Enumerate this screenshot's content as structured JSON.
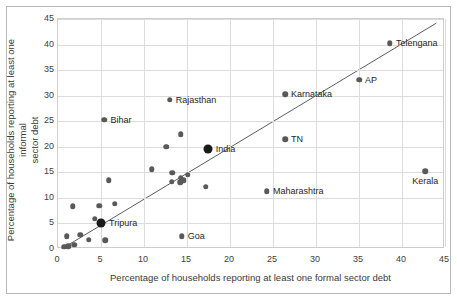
{
  "chart_data": {
    "type": "scatter",
    "title": "",
    "xlabel": "Percentage of households reporting at least one formal sector debt",
    "ylabel_line1": "Percentage of households reporting at least one informal",
    "ylabel_line2": "sector debt",
    "xlim": [
      0,
      45
    ],
    "ylim": [
      0,
      45
    ],
    "xticks": [
      0,
      5,
      10,
      15,
      20,
      25,
      30,
      35,
      40,
      45
    ],
    "yticks": [
      0,
      5,
      10,
      15,
      20,
      25,
      30,
      35,
      40,
      45
    ],
    "grid": true,
    "legend": "none",
    "annotations": [
      {
        "label": "Rajasthan",
        "x": 13.0,
        "y": 29.2,
        "side": "right"
      },
      {
        "label": "Bihar",
        "x": 5.4,
        "y": 25.3,
        "side": "right"
      },
      {
        "label": "Telengana",
        "x": 38.6,
        "y": 40.3,
        "side": "right"
      },
      {
        "label": "AP",
        "x": 35.0,
        "y": 33.1,
        "side": "right"
      },
      {
        "label": "Karnataka",
        "x": 26.4,
        "y": 30.3,
        "side": "right"
      },
      {
        "label": "TN",
        "x": 26.4,
        "y": 21.5,
        "side": "right"
      },
      {
        "label": "India",
        "x": 17.4,
        "y": 19.5,
        "side": "right",
        "highlight": true
      },
      {
        "label": "Maharashtra",
        "x": 24.3,
        "y": 11.3,
        "side": "right"
      },
      {
        "label": "Kerala",
        "x": 42.7,
        "y": 15.2,
        "side": "below"
      },
      {
        "label": "Tripura",
        "x": 5.0,
        "y": 5.0,
        "side": "right",
        "highlight": true
      },
      {
        "label": "Goa",
        "x": 14.4,
        "y": 2.5,
        "side": "right"
      }
    ],
    "points": [
      {
        "x": 13.0,
        "y": 29.2
      },
      {
        "x": 5.4,
        "y": 25.3
      },
      {
        "x": 38.6,
        "y": 40.3
      },
      {
        "x": 35.0,
        "y": 33.1
      },
      {
        "x": 26.4,
        "y": 30.3
      },
      {
        "x": 26.4,
        "y": 21.5
      },
      {
        "x": 24.3,
        "y": 11.3
      },
      {
        "x": 42.7,
        "y": 15.2
      },
      {
        "x": 14.4,
        "y": 2.5
      },
      {
        "x": 14.3,
        "y": 22.5
      },
      {
        "x": 12.6,
        "y": 20.0
      },
      {
        "x": 17.3,
        "y": 19.6
      },
      {
        "x": 10.9,
        "y": 15.6
      },
      {
        "x": 13.3,
        "y": 14.9
      },
      {
        "x": 15.1,
        "y": 14.5
      },
      {
        "x": 14.3,
        "y": 13.9
      },
      {
        "x": 14.6,
        "y": 13.5
      },
      {
        "x": 13.2,
        "y": 13.2
      },
      {
        "x": 14.2,
        "y": 13.1
      },
      {
        "x": 5.9,
        "y": 13.5
      },
      {
        "x": 17.2,
        "y": 12.2
      },
      {
        "x": 6.6,
        "y": 8.9
      },
      {
        "x": 4.8,
        "y": 8.5
      },
      {
        "x": 1.7,
        "y": 8.4
      },
      {
        "x": 4.3,
        "y": 5.9
      },
      {
        "x": 2.6,
        "y": 2.8
      },
      {
        "x": 1.0,
        "y": 2.5
      },
      {
        "x": 3.6,
        "y": 1.8
      },
      {
        "x": 5.5,
        "y": 1.7
      },
      {
        "x": 1.9,
        "y": 0.8
      },
      {
        "x": 1.2,
        "y": 0.5
      },
      {
        "x": 0.7,
        "y": 0.4
      }
    ],
    "highlight_points": [
      {
        "x": 17.4,
        "y": 19.5,
        "label": "India"
      },
      {
        "x": 5.0,
        "y": 5.0,
        "label": "Tripura"
      }
    ],
    "trendline": {
      "x1": 0.4,
      "y1": 0.0,
      "x2": 44.0,
      "y2": 44.2
    }
  }
}
